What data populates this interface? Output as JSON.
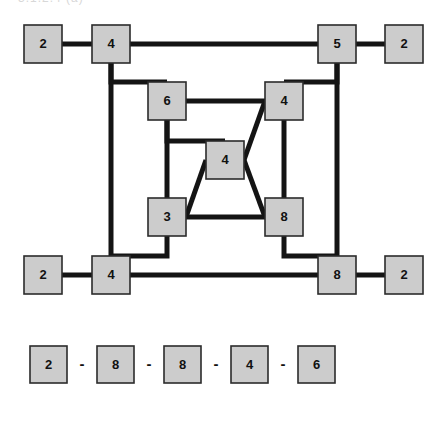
{
  "caption": {
    "text": "3.1.2.4  (a)"
  },
  "figure": {
    "kind": "node-link-diagram",
    "node_fill_color": "#cccccc",
    "node_border_color": "#2b2b2b",
    "edge_color": "#141414",
    "background_color": "#ffffff",
    "node_size": 38,
    "nodes": [
      {
        "id": "outer-left-top",
        "label": "2",
        "x": 24,
        "y": 25
      },
      {
        "id": "corner-top-left",
        "label": "4",
        "x": 92,
        "y": 25
      },
      {
        "id": "corner-top-right",
        "label": "5",
        "x": 318,
        "y": 25
      },
      {
        "id": "outer-right-top",
        "label": "2",
        "x": 385,
        "y": 25
      },
      {
        "id": "inner-top-left",
        "label": "6",
        "x": 148,
        "y": 82
      },
      {
        "id": "inner-top-right",
        "label": "4",
        "x": 265,
        "y": 82
      },
      {
        "id": "center",
        "label": "4",
        "x": 206,
        "y": 141
      },
      {
        "id": "inner-bottom-left",
        "label": "3",
        "x": 148,
        "y": 198
      },
      {
        "id": "inner-bottom-right",
        "label": "8",
        "x": 265,
        "y": 198
      },
      {
        "id": "outer-left-bottom",
        "label": "2",
        "x": 24,
        "y": 256
      },
      {
        "id": "corner-bottom-left",
        "label": "4",
        "x": 92,
        "y": 256
      },
      {
        "id": "corner-bottom-right",
        "label": "8",
        "x": 318,
        "y": 256
      },
      {
        "id": "outer-right-bottom",
        "label": "2",
        "x": 385,
        "y": 256
      }
    ],
    "edges": [
      {
        "id": "e-outerlefttop-cornertopleft",
        "from": "outer-left-top",
        "to": "corner-top-left"
      },
      {
        "id": "e-cornertopleft-cornertopright",
        "from": "corner-top-left",
        "to": "corner-top-right"
      },
      {
        "id": "e-cornertopright-outerrighttop",
        "from": "corner-top-right",
        "to": "outer-right-top"
      },
      {
        "id": "e-cornertopleft-innertopleft",
        "from": "corner-top-left",
        "to": "inner-top-left"
      },
      {
        "id": "e-cornertopright-innertopright",
        "from": "corner-top-right",
        "to": "inner-top-right"
      },
      {
        "id": "e-innertopleft-innertopright",
        "from": "inner-top-left",
        "to": "inner-top-right"
      },
      {
        "id": "e-innertopleft-center",
        "from": "inner-top-left",
        "to": "center"
      },
      {
        "id": "e-innertopright-center",
        "from": "inner-top-right",
        "to": "center"
      },
      {
        "id": "e-innertopleft-innerbottomleft",
        "from": "inner-top-left",
        "to": "inner-bottom-left"
      },
      {
        "id": "e-innertopright-innerbottomright",
        "from": "inner-top-right",
        "to": "inner-bottom-right"
      },
      {
        "id": "e-center-innerbottomleft",
        "from": "center",
        "to": "inner-bottom-left"
      },
      {
        "id": "e-center-innerbottomright",
        "from": "center",
        "to": "inner-bottom-right"
      },
      {
        "id": "e-innerbottomleft-innerbottomright",
        "from": "inner-bottom-left",
        "to": "inner-bottom-right"
      },
      {
        "id": "e-cornertopleft-cornerbottomleft",
        "from": "corner-top-left",
        "to": "corner-bottom-left"
      },
      {
        "id": "e-cornertopright-cornerbottomright",
        "from": "corner-top-right",
        "to": "corner-bottom-right"
      },
      {
        "id": "e-innerbottomleft-cornerbottomleft",
        "from": "inner-bottom-left",
        "to": "corner-bottom-left"
      },
      {
        "id": "e-innerbottomright-cornerbottomright",
        "from": "inner-bottom-right",
        "to": "corner-bottom-right"
      },
      {
        "id": "e-outerleftbottom-cornerbottomleft",
        "from": "outer-left-bottom",
        "to": "corner-bottom-left"
      },
      {
        "id": "e-cornerbottomleft-cornerbottomright",
        "from": "corner-bottom-left",
        "to": "corner-bottom-right"
      },
      {
        "id": "e-cornerbottomright-outerrightbottom",
        "from": "corner-bottom-right",
        "to": "outer-right-bottom"
      }
    ]
  },
  "sequence": {
    "separator": "-",
    "box_size": 37,
    "y": 346,
    "start_x": 30,
    "step_x": 67,
    "items": [
      {
        "label": "2"
      },
      {
        "label": "8"
      },
      {
        "label": "8"
      },
      {
        "label": "4"
      },
      {
        "label": "6"
      }
    ]
  }
}
